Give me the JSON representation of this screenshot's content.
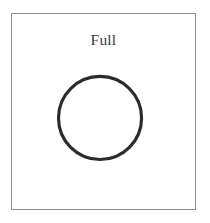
{
  "figure": {
    "label": "Full",
    "background_color": "#ffffff",
    "frame": {
      "border_color": "#8d8d8f",
      "border_width_px": 1,
      "x": 11,
      "y": 13,
      "width": 185,
      "height": 197
    },
    "shapes": [
      {
        "type": "circle",
        "name": "full-circle",
        "center_x": 100,
        "center_y": 118,
        "radius": 42,
        "stroke_color": "#2b2b2b",
        "stroke_width_px": 3,
        "fill": "none"
      }
    ],
    "label_style": {
      "color": "#3a3a3c",
      "font_size_px": 15.5,
      "align": "center"
    }
  }
}
